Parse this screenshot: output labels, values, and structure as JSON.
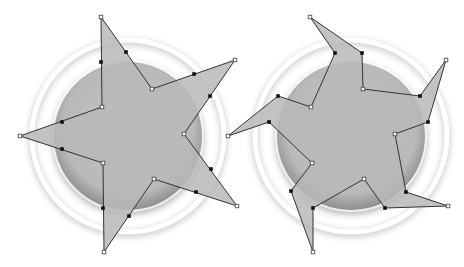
{
  "canvas": {
    "width": 464,
    "height": 267,
    "background": "#ffffff"
  },
  "colors": {
    "shape_fill": "#b8b8b8",
    "shape_fill_opacity": 0.85,
    "stroke": "#333333",
    "anchor_fill_open": "#ffffff",
    "anchor_fill_solid": "#111111",
    "ring_shadow": "#9a9a9a"
  },
  "figures": [
    {
      "name": "star-original",
      "ring": {
        "cx": 128,
        "cy": 136,
        "outer_r": 96,
        "inner_r": 74
      },
      "points": [
        [
          101,
          17
        ],
        [
          152,
          89
        ],
        [
          235,
          60
        ],
        [
          184,
          134
        ],
        [
          237,
          206
        ],
        [
          154,
          179
        ],
        [
          104,
          252
        ],
        [
          103,
          163
        ],
        [
          20,
          136
        ],
        [
          102,
          107
        ]
      ],
      "open_anchors": [
        [
          101,
          17
        ],
        [
          152,
          89
        ],
        [
          235,
          60
        ],
        [
          184,
          134
        ],
        [
          237,
          206
        ],
        [
          154,
          179
        ],
        [
          104,
          252
        ],
        [
          103,
          163
        ],
        [
          20,
          136
        ],
        [
          102,
          107
        ]
      ],
      "solid_anchors": [
        [
          101,
          62
        ],
        [
          126,
          52
        ],
        [
          194,
          74
        ],
        [
          210,
          96
        ],
        [
          211,
          169
        ],
        [
          196,
          192
        ],
        [
          129,
          216
        ],
        [
          103,
          208
        ],
        [
          62,
          122
        ],
        [
          62,
          149
        ]
      ]
    },
    {
      "name": "star-twisted",
      "ring": {
        "cx": 351,
        "cy": 136,
        "outer_r": 96,
        "inner_r": 74
      },
      "points": [
        [
          310,
          17
        ],
        [
          362,
          53
        ],
        [
          363,
          89
        ],
        [
          420,
          96
        ],
        [
          446,
          60
        ],
        [
          428,
          122
        ],
        [
          395,
          134
        ],
        [
          406,
          192
        ],
        [
          448,
          206
        ],
        [
          385,
          208
        ],
        [
          364,
          179
        ],
        [
          313,
          208
        ],
        [
          313,
          252
        ],
        [
          291,
          191
        ],
        [
          312,
          163
        ],
        [
          269,
          122
        ],
        [
          228,
          136
        ],
        [
          278,
          96
        ],
        [
          311,
          107
        ],
        [
          335,
          53
        ]
      ],
      "open_anchors": [
        [
          310,
          17
        ],
        [
          363,
          89
        ],
        [
          446,
          60
        ],
        [
          395,
          134
        ],
        [
          448,
          206
        ],
        [
          364,
          179
        ],
        [
          313,
          252
        ],
        [
          312,
          163
        ],
        [
          228,
          136
        ],
        [
          311,
          107
        ]
      ],
      "solid_anchors": [
        [
          362,
          53
        ],
        [
          420,
          96
        ],
        [
          428,
          122
        ],
        [
          406,
          192
        ],
        [
          385,
          208
        ],
        [
          313,
          208
        ],
        [
          291,
          191
        ],
        [
          269,
          122
        ],
        [
          278,
          96
        ],
        [
          335,
          53
        ]
      ]
    }
  ]
}
